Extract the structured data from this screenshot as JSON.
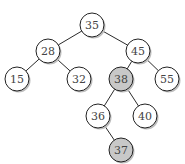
{
  "diagram": {
    "type": "binary-search-tree",
    "colors": {
      "normal_fill": "#ffffff",
      "highlight_fill": "#c8c8c8",
      "edge": "#2a2a2a"
    },
    "radius": 12,
    "nodes": [
      {
        "id": "n35",
        "label": "35",
        "x": 92,
        "y": 25,
        "highlight": false
      },
      {
        "id": "n28",
        "label": "28",
        "x": 48,
        "y": 51,
        "highlight": false
      },
      {
        "id": "n45",
        "label": "45",
        "x": 138,
        "y": 51,
        "highlight": false
      },
      {
        "id": "n15",
        "label": "15",
        "x": 17,
        "y": 79,
        "highlight": false
      },
      {
        "id": "n32",
        "label": "32",
        "x": 79,
        "y": 79,
        "highlight": false
      },
      {
        "id": "n38",
        "label": "38",
        "x": 121,
        "y": 79,
        "highlight": true
      },
      {
        "id": "n55",
        "label": "55",
        "x": 167,
        "y": 79,
        "highlight": false
      },
      {
        "id": "n36",
        "label": "36",
        "x": 98,
        "y": 116,
        "highlight": false
      },
      {
        "id": "n40",
        "label": "40",
        "x": 145,
        "y": 116,
        "highlight": false
      },
      {
        "id": "n37",
        "label": "37",
        "x": 121,
        "y": 150,
        "highlight": true
      }
    ],
    "edges": [
      [
        "n35",
        "n28"
      ],
      [
        "n35",
        "n45"
      ],
      [
        "n28",
        "n15"
      ],
      [
        "n28",
        "n32"
      ],
      [
        "n45",
        "n38"
      ],
      [
        "n45",
        "n55"
      ],
      [
        "n38",
        "n36"
      ],
      [
        "n38",
        "n40"
      ],
      [
        "n36",
        "n37"
      ]
    ]
  }
}
